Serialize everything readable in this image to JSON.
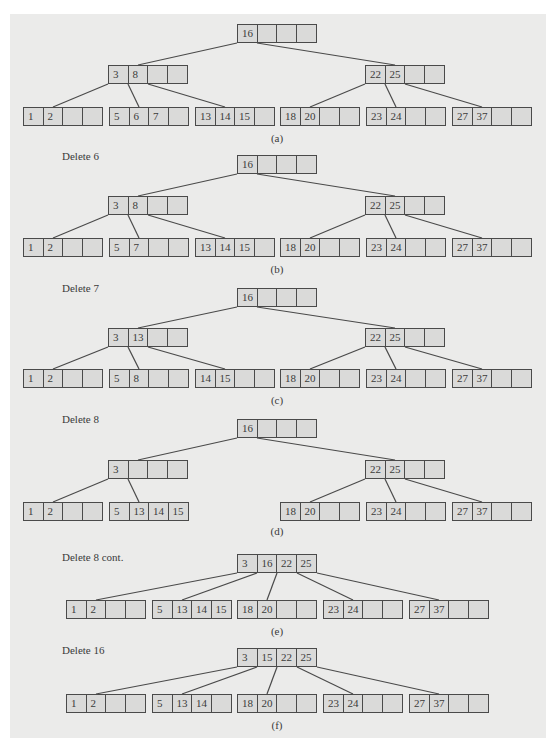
{
  "figure": {
    "cell_width": 20,
    "node_height": 19,
    "colors": {
      "panel": "#ebebea",
      "cell": "#dadad9",
      "border": "#4a4a4a",
      "text": "#3a3a3a"
    },
    "sections": [
      {
        "id": "a",
        "label": "",
        "caption": "(a)",
        "caption_y": 132,
        "nodes": [
          {
            "id": "root",
            "x": 237,
            "y": 24,
            "keys": [
              "16",
              "",
              "",
              ""
            ]
          },
          {
            "id": "i1",
            "x": 108,
            "y": 65,
            "keys": [
              "3",
              "8",
              "",
              ""
            ]
          },
          {
            "id": "i2",
            "x": 365,
            "y": 65,
            "keys": [
              "22",
              "25",
              "",
              ""
            ]
          },
          {
            "id": "l1",
            "x": 23,
            "y": 107,
            "keys": [
              "1",
              "2",
              "",
              ""
            ]
          },
          {
            "id": "l2",
            "x": 109,
            "y": 107,
            "keys": [
              "5",
              "6",
              "7",
              ""
            ]
          },
          {
            "id": "l3",
            "x": 195,
            "y": 107,
            "keys": [
              "13",
              "14",
              "15",
              ""
            ]
          },
          {
            "id": "l4",
            "x": 280,
            "y": 107,
            "keys": [
              "18",
              "20",
              "",
              ""
            ]
          },
          {
            "id": "l5",
            "x": 366,
            "y": 107,
            "keys": [
              "23",
              "24",
              "",
              ""
            ]
          },
          {
            "id": "l6",
            "x": 452,
            "y": 107,
            "keys": [
              "27",
              "37",
              "",
              ""
            ]
          }
        ],
        "edges": [
          [
            "root",
            0,
            "i1"
          ],
          [
            "root",
            1,
            "i2"
          ],
          [
            "i1",
            0,
            "l1"
          ],
          [
            "i1",
            1,
            "l2"
          ],
          [
            "i1",
            2,
            "l3"
          ],
          [
            "i2",
            0,
            "l4"
          ],
          [
            "i2",
            1,
            "l5"
          ],
          [
            "i2",
            2,
            "l6"
          ]
        ]
      },
      {
        "id": "b",
        "label": "Delete 6",
        "label_y": 150,
        "caption": "(b)",
        "caption_y": 263,
        "nodes": [
          {
            "id": "root",
            "x": 237,
            "y": 155,
            "keys": [
              "16",
              "",
              "",
              ""
            ]
          },
          {
            "id": "i1",
            "x": 108,
            "y": 196,
            "keys": [
              "3",
              "8",
              "",
              ""
            ]
          },
          {
            "id": "i2",
            "x": 365,
            "y": 196,
            "keys": [
              "22",
              "25",
              "",
              ""
            ]
          },
          {
            "id": "l1",
            "x": 23,
            "y": 238,
            "keys": [
              "1",
              "2",
              "",
              ""
            ]
          },
          {
            "id": "l2",
            "x": 109,
            "y": 238,
            "keys": [
              "5",
              "7",
              "",
              ""
            ]
          },
          {
            "id": "l3",
            "x": 195,
            "y": 238,
            "keys": [
              "13",
              "14",
              "15",
              ""
            ]
          },
          {
            "id": "l4",
            "x": 280,
            "y": 238,
            "keys": [
              "18",
              "20",
              "",
              ""
            ]
          },
          {
            "id": "l5",
            "x": 366,
            "y": 238,
            "keys": [
              "23",
              "24",
              "",
              ""
            ]
          },
          {
            "id": "l6",
            "x": 452,
            "y": 238,
            "keys": [
              "27",
              "37",
              "",
              ""
            ]
          }
        ],
        "edges": [
          [
            "root",
            0,
            "i1"
          ],
          [
            "root",
            1,
            "i2"
          ],
          [
            "i1",
            0,
            "l1"
          ],
          [
            "i1",
            1,
            "l2"
          ],
          [
            "i1",
            2,
            "l3"
          ],
          [
            "i2",
            0,
            "l4"
          ],
          [
            "i2",
            1,
            "l5"
          ],
          [
            "i2",
            2,
            "l6"
          ]
        ]
      },
      {
        "id": "c",
        "label": "Delete 7",
        "label_y": 282,
        "caption": "(c)",
        "caption_y": 394,
        "nodes": [
          {
            "id": "root",
            "x": 237,
            "y": 288,
            "keys": [
              "16",
              "",
              "",
              ""
            ]
          },
          {
            "id": "i1",
            "x": 108,
            "y": 328,
            "keys": [
              "3",
              "13",
              "",
              ""
            ]
          },
          {
            "id": "i2",
            "x": 365,
            "y": 328,
            "keys": [
              "22",
              "25",
              "",
              ""
            ]
          },
          {
            "id": "l1",
            "x": 23,
            "y": 369,
            "keys": [
              "1",
              "2",
              "",
              ""
            ]
          },
          {
            "id": "l2",
            "x": 109,
            "y": 369,
            "keys": [
              "5",
              "8",
              "",
              ""
            ]
          },
          {
            "id": "l3",
            "x": 195,
            "y": 369,
            "keys": [
              "14",
              "15",
              "",
              ""
            ]
          },
          {
            "id": "l4",
            "x": 280,
            "y": 369,
            "keys": [
              "18",
              "20",
              "",
              ""
            ]
          },
          {
            "id": "l5",
            "x": 366,
            "y": 369,
            "keys": [
              "23",
              "24",
              "",
              ""
            ]
          },
          {
            "id": "l6",
            "x": 452,
            "y": 369,
            "keys": [
              "27",
              "37",
              "",
              ""
            ]
          }
        ],
        "edges": [
          [
            "root",
            0,
            "i1"
          ],
          [
            "root",
            1,
            "i2"
          ],
          [
            "i1",
            0,
            "l1"
          ],
          [
            "i1",
            1,
            "l2"
          ],
          [
            "i1",
            2,
            "l3"
          ],
          [
            "i2",
            0,
            "l4"
          ],
          [
            "i2",
            1,
            "l5"
          ],
          [
            "i2",
            2,
            "l6"
          ]
        ]
      },
      {
        "id": "d",
        "label": "Delete 8",
        "label_y": 413,
        "caption": "(d)",
        "caption_y": 525,
        "nodes": [
          {
            "id": "root",
            "x": 237,
            "y": 419,
            "keys": [
              "16",
              "",
              "",
              ""
            ]
          },
          {
            "id": "i1",
            "x": 108,
            "y": 460,
            "keys": [
              "3",
              "",
              "",
              ""
            ]
          },
          {
            "id": "i2",
            "x": 365,
            "y": 460,
            "keys": [
              "22",
              "25",
              "",
              ""
            ]
          },
          {
            "id": "l1",
            "x": 23,
            "y": 502,
            "keys": [
              "1",
              "2",
              "",
              ""
            ]
          },
          {
            "id": "l2",
            "x": 109,
            "y": 502,
            "keys": [
              "5",
              "13",
              "14",
              "15"
            ]
          },
          {
            "id": "l4",
            "x": 280,
            "y": 502,
            "keys": [
              "18",
              "20",
              "",
              ""
            ]
          },
          {
            "id": "l5",
            "x": 366,
            "y": 502,
            "keys": [
              "23",
              "24",
              "",
              ""
            ]
          },
          {
            "id": "l6",
            "x": 452,
            "y": 502,
            "keys": [
              "27",
              "37",
              "",
              ""
            ]
          }
        ],
        "edges": [
          [
            "root",
            0,
            "i1"
          ],
          [
            "root",
            1,
            "i2"
          ],
          [
            "i1",
            0,
            "l1"
          ],
          [
            "i1",
            1,
            "l2"
          ],
          [
            "i2",
            0,
            "l4"
          ],
          [
            "i2",
            1,
            "l5"
          ],
          [
            "i2",
            2,
            "l6"
          ]
        ]
      },
      {
        "id": "e",
        "label": "Delete 8 cont.",
        "label_y": 551,
        "caption": "(e)",
        "caption_y": 625,
        "nodes": [
          {
            "id": "root",
            "x": 237,
            "y": 554,
            "keys": [
              "3",
              "16",
              "22",
              "25"
            ]
          },
          {
            "id": "l1",
            "x": 66,
            "y": 600,
            "keys": [
              "1",
              "2",
              "",
              ""
            ]
          },
          {
            "id": "l2",
            "x": 152,
            "y": 600,
            "keys": [
              "5",
              "13",
              "14",
              "15"
            ]
          },
          {
            "id": "l3",
            "x": 237,
            "y": 600,
            "keys": [
              "18",
              "20",
              "",
              ""
            ]
          },
          {
            "id": "l4",
            "x": 323,
            "y": 600,
            "keys": [
              "23",
              "24",
              "",
              ""
            ]
          },
          {
            "id": "l5",
            "x": 409,
            "y": 600,
            "keys": [
              "27",
              "37",
              "",
              ""
            ]
          }
        ],
        "edges": [
          [
            "root",
            0,
            "l1"
          ],
          [
            "root",
            1,
            "l2"
          ],
          [
            "root",
            2,
            "l3"
          ],
          [
            "root",
            3,
            "l4"
          ],
          [
            "root",
            4,
            "l5"
          ]
        ]
      },
      {
        "id": "f",
        "label": "Delete 16",
        "label_y": 644,
        "caption": "(f)",
        "caption_y": 719,
        "nodes": [
          {
            "id": "root",
            "x": 237,
            "y": 648,
            "keys": [
              "3",
              "15",
              "22",
              "25"
            ]
          },
          {
            "id": "l1",
            "x": 66,
            "y": 694,
            "keys": [
              "1",
              "2",
              "",
              ""
            ]
          },
          {
            "id": "l2",
            "x": 152,
            "y": 694,
            "keys": [
              "5",
              "13",
              "14",
              ""
            ]
          },
          {
            "id": "l3",
            "x": 237,
            "y": 694,
            "keys": [
              "18",
              "20",
              "",
              ""
            ]
          },
          {
            "id": "l4",
            "x": 323,
            "y": 694,
            "keys": [
              "23",
              "24",
              "",
              ""
            ]
          },
          {
            "id": "l5",
            "x": 409,
            "y": 694,
            "keys": [
              "27",
              "37",
              "",
              ""
            ]
          }
        ],
        "edges": [
          [
            "root",
            0,
            "l1"
          ],
          [
            "root",
            1,
            "l2"
          ],
          [
            "root",
            2,
            "l3"
          ],
          [
            "root",
            3,
            "l4"
          ],
          [
            "root",
            4,
            "l5"
          ]
        ]
      }
    ]
  }
}
